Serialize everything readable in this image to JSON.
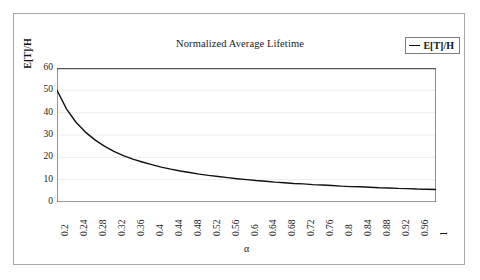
{
  "figure": {
    "frame_color": "#a8a8a8",
    "background": "#ffffff"
  },
  "legend": {
    "label": "E[T]/H",
    "marker": "line-marker",
    "position": "top-right"
  },
  "chart_data": {
    "type": "line",
    "title": "Normalized Average Lifetime",
    "xlabel": "α",
    "ylabel": "E[T]/H",
    "xlim": [
      0.2,
      1.0
    ],
    "ylim": [
      0,
      60
    ],
    "grid": true,
    "grid_color": "#ececec",
    "line_color": "#111111",
    "legend_position": "top-right",
    "ytick_labels": [
      "0",
      "10",
      "20",
      "30",
      "40",
      "50",
      "60"
    ],
    "ytick_values": [
      0,
      10,
      20,
      30,
      40,
      50,
      60
    ],
    "xtick_labels": [
      "0.2",
      "0.24",
      "0.28",
      "0.32",
      "0.36",
      "0.4",
      "0.44",
      "0.48",
      "0.52",
      "0.56",
      "0.6",
      "0.64",
      "0.68",
      "0.72",
      "0.76",
      "0.8",
      "0.84",
      "0.88",
      "0.92",
      "0.96",
      "1"
    ],
    "xtick_values": [
      0.2,
      0.24,
      0.28,
      0.32,
      0.36,
      0.4,
      0.44,
      0.48,
      0.52,
      0.56,
      0.6,
      0.64,
      0.68,
      0.72,
      0.76,
      0.8,
      0.84,
      0.88,
      0.92,
      0.96,
      1.0
    ],
    "minor_tick_step": 0.01,
    "series": [
      {
        "name": "E[T]/H",
        "x": [
          0.2,
          0.22,
          0.24,
          0.26,
          0.28,
          0.3,
          0.32,
          0.34,
          0.36,
          0.38,
          0.4,
          0.42,
          0.44,
          0.46,
          0.48,
          0.5,
          0.52,
          0.54,
          0.56,
          0.58,
          0.6,
          0.62,
          0.64,
          0.66,
          0.68,
          0.7,
          0.72,
          0.74,
          0.76,
          0.78,
          0.8,
          0.82,
          0.84,
          0.86,
          0.88,
          0.9,
          0.92,
          0.94,
          0.96,
          0.98,
          1.0
        ],
        "y": [
          50.0,
          41.7,
          35.7,
          31.3,
          27.8,
          25.0,
          22.7,
          20.8,
          19.2,
          17.9,
          16.7,
          15.6,
          14.7,
          13.9,
          13.2,
          12.5,
          11.9,
          11.4,
          10.9,
          10.4,
          10.0,
          9.6,
          9.3,
          8.9,
          8.6,
          8.3,
          8.1,
          7.8,
          7.6,
          7.4,
          7.1,
          6.9,
          6.8,
          6.6,
          6.4,
          6.3,
          6.1,
          6.0,
          5.8,
          5.7,
          5.6
        ]
      }
    ]
  }
}
